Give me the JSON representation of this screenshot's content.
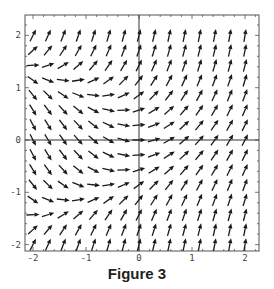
{
  "caption": "Figure 3",
  "chart_data": {
    "type": "vector_field",
    "title": "Figure 3",
    "field": "dy/dx = x + y^2 (direction field, normalized arrows)",
    "xlabel": "",
    "ylabel": "",
    "xlim": [
      -2.15,
      2.27
    ],
    "ylim": [
      -2.12,
      2.4
    ],
    "x_ticks": [
      -2,
      -1,
      0,
      1,
      2
    ],
    "y_ticks": [
      -2,
      -1,
      0,
      1,
      2
    ],
    "x_tick_labels": [
      "-2",
      "-1",
      "0",
      "1",
      "2"
    ],
    "y_tick_labels": [
      "-2",
      "-1",
      "0",
      "1",
      "2"
    ],
    "grid": {
      "x_start": -2,
      "x_end": 2,
      "y_start": -2,
      "y_end": 2,
      "count": 15
    },
    "zero_slope_curve": "y^2 = -x (slopes zero at x=-2,y=±1.41; x=-1,y=±1; x=0,y=0)",
    "axes_lines": true,
    "grid_lines": false
  },
  "style": {
    "arrow_color": "#1a1a1a",
    "frame_color": "#555555",
    "axis_color": "#333333"
  }
}
